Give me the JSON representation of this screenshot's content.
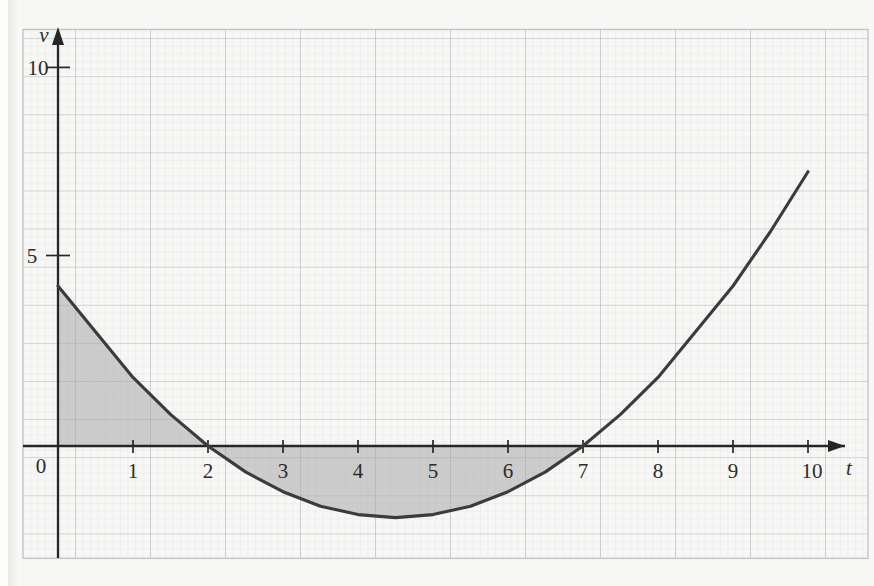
{
  "figure": {
    "kind": "graph-paper-velocity-time-graph",
    "background_color": "#f7f7f5",
    "grid_major_color": "#b9b9bd",
    "grid_minor_color": "#dcdce0",
    "axis_color": "#262626",
    "curve_color": "#3b3b3b",
    "shade_color": "#a9a9a9",
    "border_color": "#c3c3c6"
  },
  "axes": {
    "x_axis_name": "t",
    "y_axis_name": "v",
    "origin_label": "0",
    "x_ticks": [
      "1",
      "2",
      "3",
      "4",
      "5",
      "6",
      "7",
      "8",
      "9",
      "10"
    ],
    "y_ticks": [
      "5",
      "10"
    ],
    "x_arrow": "arrow-right",
    "y_arrow": "arrow-up"
  },
  "chart_data": {
    "type": "line",
    "title": "",
    "xlabel": "t",
    "ylabel": "v",
    "xlim": [
      -0.4,
      10.9
    ],
    "ylim": [
      -3.0,
      11.3
    ],
    "grid": true,
    "grid_major_step_x": 1,
    "grid_major_step_y": 1,
    "grid_minor_subdivisions": 5,
    "legend": "none",
    "xticks": [
      0,
      1,
      2,
      3,
      4,
      5,
      6,
      7,
      8,
      9,
      10
    ],
    "xticklabels": [
      "0",
      "1",
      "2",
      "3",
      "4",
      "5",
      "6",
      "7",
      "8",
      "9",
      "10"
    ],
    "yticks": [
      5,
      10
    ],
    "yticklabels": [
      "5",
      "10"
    ],
    "series": [
      {
        "name": "v(t)",
        "equation": "v = 0.3(t-2)(t-7)",
        "roots": [
          2,
          7
        ],
        "minimum": {
          "t": 4.5,
          "v": -1.9
        },
        "x": [
          0,
          0.5,
          1,
          1.5,
          2,
          2.5,
          3,
          3.5,
          4,
          4.5,
          5,
          5.5,
          6,
          6.5,
          7,
          7.5,
          8,
          8.5,
          9,
          9.5,
          10
        ],
        "values": [
          4.2,
          3.0,
          1.8,
          0.83,
          0.0,
          -0.68,
          -1.2,
          -1.58,
          -1.8,
          -1.88,
          -1.8,
          -1.58,
          -1.2,
          -0.68,
          0.0,
          0.83,
          1.8,
          3.0,
          4.2,
          5.63,
          7.2
        ]
      }
    ],
    "shaded_regions": [
      {
        "name": "region-above-axis-0-to-2",
        "t_from": 0,
        "t_to": 2,
        "side": "above-axis",
        "fill": "#a9a9a9"
      },
      {
        "name": "region-below-axis-2-to-7",
        "t_from": 2,
        "t_to": 7,
        "side": "below-axis",
        "fill": "#a9a9a9"
      }
    ]
  }
}
